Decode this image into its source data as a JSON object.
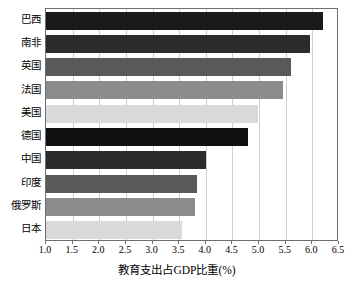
{
  "chart_data": {
    "type": "bar",
    "orientation": "horizontal",
    "title": "",
    "xlabel": "教育支出占GDP比重(%)",
    "ylabel": "",
    "xlim": [
      1.0,
      6.5
    ],
    "xticks": [
      "1.0",
      "1.5",
      "2.0",
      "2.5",
      "3.0",
      "3.5",
      "4.0",
      "4.5",
      "5.0",
      "5.5",
      "6.0",
      "6.5"
    ],
    "xtick_values": [
      1.0,
      1.5,
      2.0,
      2.5,
      3.0,
      3.5,
      4.0,
      4.5,
      5.0,
      5.5,
      6.0,
      6.5
    ],
    "grid": "vertical",
    "legend": "none",
    "categories": [
      "巴西",
      "南非",
      "英国",
      "法国",
      "美国",
      "德国",
      "中国",
      "印度",
      "俄罗斯",
      "日本"
    ],
    "values": [
      6.2,
      5.95,
      5.6,
      5.45,
      4.98,
      4.8,
      4.0,
      3.83,
      3.8,
      3.55
    ],
    "bar_colors": [
      "#1a1a1a",
      "#2b2b2b",
      "#595959",
      "#8c8c8c",
      "#d9d9d9",
      "#111111",
      "#2b2b2b",
      "#595959",
      "#8c8c8c",
      "#d9d9d9"
    ],
    "axis_color": "#6e6e6e",
    "grid_color": "#cfcfcf",
    "background": "#ffffff"
  }
}
